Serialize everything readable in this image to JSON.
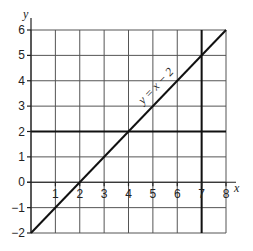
{
  "chart_data": {
    "type": "line",
    "title": "",
    "xlabel": "x",
    "ylabel": "y",
    "xlim": [
      0,
      8
    ],
    "ylim": [
      -2,
      6
    ],
    "grid": true,
    "x_ticks": [
      1,
      2,
      3,
      4,
      5,
      6,
      7,
      8
    ],
    "y_ticks": [
      -2,
      -1,
      0,
      1,
      2,
      3,
      4,
      5,
      6
    ],
    "x_tick_labels": [
      "1",
      "2",
      "3",
      "4",
      "5",
      "6",
      "7",
      "8"
    ],
    "y_tick_labels": [
      "−2",
      "−1",
      "0",
      "1",
      "2",
      "3",
      "4",
      "5",
      "6"
    ],
    "series": [
      {
        "name": "y = x − 2",
        "label": "y = x − 2",
        "x": [
          0,
          8
        ],
        "y": [
          -2,
          6
        ]
      }
    ],
    "reference_lines": [
      {
        "name": "y = 2",
        "orientation": "horizontal",
        "value": 2
      },
      {
        "name": "x = 7",
        "orientation": "vertical",
        "value": 7
      }
    ]
  }
}
